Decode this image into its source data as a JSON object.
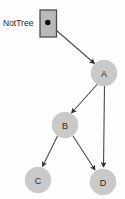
{
  "diagram": {
    "title_label": "NotTree",
    "type": "directed-graph",
    "background_color": "#fdfdfd",
    "node_fill_color": "#c9c9c9",
    "edge_color": "#4a4a4a",
    "pointer": {
      "label": "NotTree",
      "box_fill_color": "#b9b9b9",
      "box_border_color": "#4c4c4c",
      "dot_color": "#0d0d0d",
      "target": "A"
    },
    "nodes": [
      {
        "id": "A",
        "label": "A",
        "cx": 104,
        "cy": 73,
        "r": 13
      },
      {
        "id": "B",
        "label": "B",
        "cx": 65,
        "cy": 125,
        "r": 13
      },
      {
        "id": "C",
        "label": "C",
        "cx": 38,
        "cy": 180,
        "r": 13
      },
      {
        "id": "D",
        "label": "D",
        "cx": 103,
        "cy": 182,
        "r": 13
      }
    ],
    "edges": [
      {
        "from": "pointer",
        "to": "A",
        "name": "edge-pointer-a"
      },
      {
        "from": "A",
        "to": "B",
        "name": "edge-a-b"
      },
      {
        "from": "A",
        "to": "D",
        "name": "edge-a-d"
      },
      {
        "from": "B",
        "to": "C",
        "name": "edge-b-c"
      },
      {
        "from": "B",
        "to": "D",
        "name": "edge-b-d"
      }
    ]
  }
}
